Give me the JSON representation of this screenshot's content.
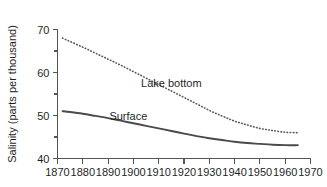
{
  "chart_data": {
    "type": "line",
    "title": "",
    "subtitle": "",
    "xlabel": "",
    "ylabel": "Salinity (parts per thousand)",
    "xlim": [
      1870,
      1970
    ],
    "ylim": [
      40,
      70
    ],
    "grid": false,
    "legend_position": "inline-annotation",
    "x_ticks": [
      1870,
      1880,
      1890,
      1900,
      1910,
      1920,
      1930,
      1940,
      1950,
      1960,
      1970
    ],
    "x_tick_labels": [
      "1870",
      "1880",
      "1890",
      "1900",
      "1910",
      "1920",
      "1930",
      "1940",
      "1950",
      "1960",
      "1970"
    ],
    "y_ticks_major": [
      40,
      50,
      60,
      70
    ],
    "y_tick_labels": [
      "40",
      "50",
      "60",
      "70"
    ],
    "y_ticks_minor": [
      45,
      55,
      65
    ],
    "annotations": [
      {
        "text": "Lake bottom",
        "x": 1915,
        "y": 56.6
      },
      {
        "text": "Surface",
        "x": 1898,
        "y": 49.0
      }
    ],
    "series": [
      {
        "name": "Lake bottom",
        "style": "dotted",
        "color": "#5a5a5a",
        "x": [
          1872,
          1875,
          1880,
          1885,
          1890,
          1895,
          1900,
          1905,
          1910,
          1915,
          1920,
          1925,
          1930,
          1935,
          1940,
          1945,
          1950,
          1955,
          1960,
          1965
        ],
        "values": [
          68.0,
          67.2,
          65.9,
          64.5,
          63.1,
          61.7,
          60.2,
          58.7,
          57.2,
          55.7,
          54.2,
          52.7,
          51.2,
          49.9,
          48.7,
          47.8,
          47.0,
          46.5,
          46.1,
          46.0
        ]
      },
      {
        "name": "Surface",
        "style": "solid",
        "color": "#4a4a4a",
        "x": [
          1872,
          1875,
          1880,
          1885,
          1890,
          1895,
          1900,
          1905,
          1910,
          1915,
          1920,
          1925,
          1930,
          1935,
          1940,
          1945,
          1950,
          1955,
          1960,
          1965
        ],
        "values": [
          51.0,
          50.8,
          50.4,
          49.9,
          49.4,
          48.8,
          48.2,
          47.6,
          47.0,
          46.4,
          45.8,
          45.2,
          44.7,
          44.3,
          43.9,
          43.6,
          43.4,
          43.2,
          43.1,
          43.1
        ]
      }
    ]
  }
}
